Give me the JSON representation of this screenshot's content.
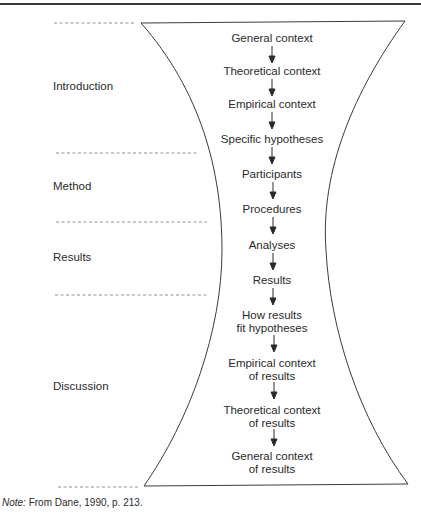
{
  "diagram": {
    "shape": "hourglass",
    "sections": [
      {
        "label": "Introduction"
      },
      {
        "label": "Method"
      },
      {
        "label": "Results"
      },
      {
        "label": "Discussion"
      }
    ],
    "steps": [
      {
        "line1": "General context",
        "line2": ""
      },
      {
        "line1": "Theoretical context",
        "line2": ""
      },
      {
        "line1": "Empirical context",
        "line2": ""
      },
      {
        "line1": "Specific hypotheses",
        "line2": ""
      },
      {
        "line1": "Participants",
        "line2": ""
      },
      {
        "line1": "Procedures",
        "line2": ""
      },
      {
        "line1": "Analyses",
        "line2": ""
      },
      {
        "line1": "Results",
        "line2": ""
      },
      {
        "line1": "How results",
        "line2": "fit hypotheses"
      },
      {
        "line1": "Empirical context",
        "line2": "of results"
      },
      {
        "line1": "Theoretical context",
        "line2": "of results"
      },
      {
        "line1": "General context",
        "line2": "of results"
      }
    ]
  },
  "note": {
    "label": "Note:",
    "text": " From Dane, 1990, p. 213."
  },
  "colors": {
    "line": "#3a3a3a",
    "text": "#2a2a2a",
    "dash": "#777777"
  }
}
